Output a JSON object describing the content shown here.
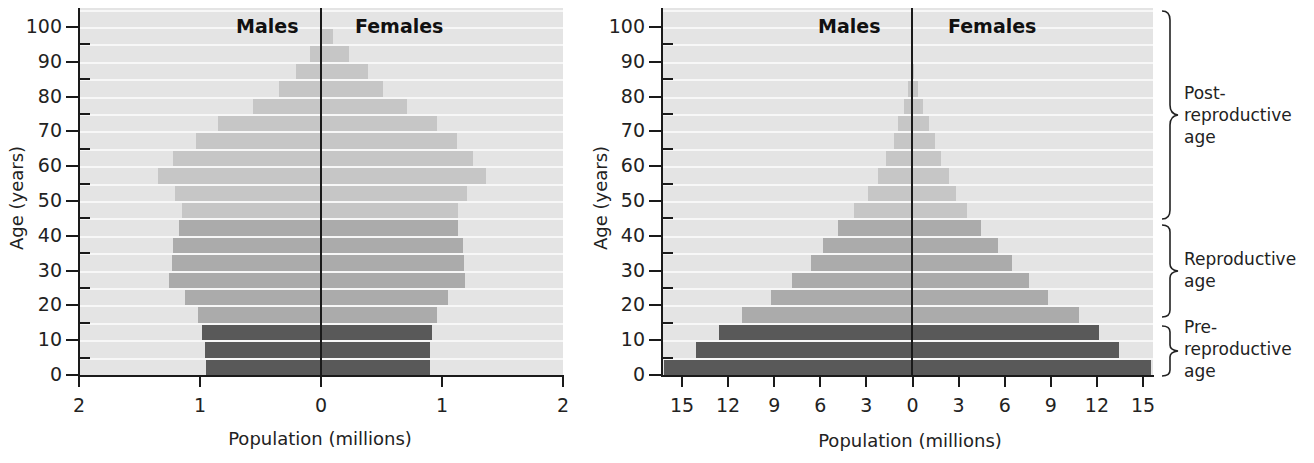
{
  "charts_common": {
    "age_groups": [
      "0-4",
      "5-9",
      "10-14",
      "15-19",
      "20-24",
      "25-29",
      "30-34",
      "35-39",
      "40-44",
      "45-49",
      "50-54",
      "55-59",
      "60-64",
      "65-69",
      "70-74",
      "75-79",
      "80-84",
      "85-89",
      "90-94",
      "95-99",
      "100+"
    ],
    "category_by_group": [
      "pre",
      "pre",
      "pre",
      "repro",
      "repro",
      "repro",
      "repro",
      "repro",
      "repro",
      "post",
      "post",
      "post",
      "post",
      "post",
      "post",
      "post",
      "post",
      "post",
      "post",
      "post",
      "post"
    ],
    "colors": {
      "background": "#e4e4e4",
      "band_line": "#f7f7f7",
      "post_reproductive": "#c6c6c6",
      "reproductive": "#ababab",
      "pre_reproductive": "#595959",
      "axis": "#1a1a1a"
    }
  },
  "chart_data": [
    {
      "type": "bar",
      "subtype": "population-pyramid",
      "title": "",
      "xlabel": "Population (millions)",
      "ylabel": "Age (years)",
      "xlim": [
        -2,
        2
      ],
      "ylim": [
        0,
        105
      ],
      "x_ticks": [
        "2",
        "1",
        "0",
        "1",
        "2"
      ],
      "y_ticks": [
        "0",
        "10",
        "20",
        "30",
        "40",
        "50",
        "60",
        "70",
        "80",
        "90",
        "100"
      ],
      "grid": false,
      "legend": null,
      "side_labels": {
        "left": "Males",
        "right": "Females"
      },
      "categories": [
        "0-4",
        "5-9",
        "10-14",
        "15-19",
        "20-24",
        "25-29",
        "30-34",
        "35-39",
        "40-44",
        "45-49",
        "50-54",
        "55-59",
        "60-64",
        "65-69",
        "70-74",
        "75-79",
        "80-84",
        "85-89",
        "90-94",
        "95-99",
        "100+"
      ],
      "series": [
        {
          "name": "Males",
          "values": [
            0.95,
            0.96,
            0.98,
            1.02,
            1.12,
            1.26,
            1.23,
            1.22,
            1.17,
            1.15,
            1.21,
            1.35,
            1.22,
            1.03,
            0.85,
            0.56,
            0.35,
            0.21,
            0.09,
            0.01,
            0.0
          ]
        },
        {
          "name": "Females",
          "values": [
            0.9,
            0.9,
            0.92,
            0.96,
            1.05,
            1.19,
            1.18,
            1.17,
            1.13,
            1.13,
            1.21,
            1.36,
            1.26,
            1.12,
            0.96,
            0.71,
            0.51,
            0.39,
            0.23,
            0.1,
            0.0
          ]
        }
      ]
    },
    {
      "type": "bar",
      "subtype": "population-pyramid",
      "title": "",
      "xlabel": "Population (millions)",
      "ylabel": "Age (years)",
      "xlim": [
        -16,
        16
      ],
      "ylim": [
        0,
        105
      ],
      "x_ticks": [
        "15",
        "12",
        "9",
        "6",
        "3",
        "0",
        "3",
        "6",
        "9",
        "12",
        "15"
      ],
      "y_ticks": [
        "0",
        "10",
        "20",
        "30",
        "40",
        "50",
        "60",
        "70",
        "80",
        "90",
        "100"
      ],
      "grid": false,
      "legend": null,
      "side_labels": {
        "left": "Males",
        "right": "Females"
      },
      "annotations": [
        {
          "label": "Post-reproductive age",
          "range": [
            45,
            105
          ]
        },
        {
          "label": "Reproductive age",
          "range": [
            15,
            45
          ]
        },
        {
          "label": "Pre-reproductive age",
          "range": [
            0,
            15
          ]
        }
      ],
      "categories": [
        "0-4",
        "5-9",
        "10-14",
        "15-19",
        "20-24",
        "25-29",
        "30-34",
        "35-39",
        "40-44",
        "45-49",
        "50-54",
        "55-59",
        "60-64",
        "65-69",
        "70-74",
        "75-79",
        "80-84",
        "85-89",
        "90-94",
        "95-99",
        "100+"
      ],
      "series": [
        {
          "name": "Males",
          "values": [
            16.2,
            14.1,
            12.6,
            11.1,
            9.2,
            7.8,
            6.6,
            5.8,
            4.8,
            3.8,
            2.9,
            2.2,
            1.7,
            1.2,
            0.9,
            0.5,
            0.25,
            0.05,
            0,
            0,
            0
          ]
        },
        {
          "name": "Females",
          "values": [
            15.6,
            13.5,
            12.2,
            10.9,
            8.9,
            7.6,
            6.5,
            5.6,
            4.5,
            3.6,
            2.9,
            2.4,
            1.9,
            1.5,
            1.1,
            0.7,
            0.4,
            0.1,
            0,
            0,
            0
          ]
        }
      ]
    }
  ],
  "labels": {
    "males": "Males",
    "females": "Females",
    "x_title": "Population (millions)",
    "y_title": "Age (years)",
    "post_repro": [
      "Post-",
      "reproductive",
      "age"
    ],
    "repro": [
      "Reproductive",
      "age"
    ],
    "pre_repro": [
      "Pre-",
      "reproductive",
      "age"
    ]
  }
}
